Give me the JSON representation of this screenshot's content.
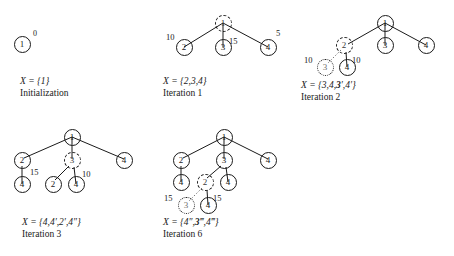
{
  "figure": {
    "background_color": "#ffffff",
    "line_color": "#1a1a1a",
    "dimmed_color": "#777777"
  },
  "panels": [
    {
      "id": "panel-initialization",
      "caption_set": "X = {1}",
      "caption_iteration": "Initialization",
      "superscript": "0",
      "nodes": [
        {
          "id": "n1",
          "label": "1",
          "style": "solid",
          "x": 22,
          "y": 44
        }
      ],
      "edges": [],
      "weights": []
    },
    {
      "id": "panel-iteration-1",
      "caption_set": "X = {2,3,4}",
      "caption_iteration": "Iteration 1",
      "nodes": [
        {
          "id": "n1",
          "label": "1",
          "style": "dashed",
          "x": 223,
          "y": 23
        },
        {
          "id": "n2",
          "label": "2",
          "style": "solid",
          "x": 184,
          "y": 47
        },
        {
          "id": "n3",
          "label": "3",
          "style": "solid",
          "x": 223,
          "y": 47
        },
        {
          "id": "n4",
          "label": "4",
          "style": "solid",
          "x": 268,
          "y": 47
        }
      ],
      "edges": [
        {
          "from": "n1",
          "to": "n2"
        },
        {
          "from": "n1",
          "to": "n3"
        },
        {
          "from": "n1",
          "to": "n4"
        }
      ],
      "weights": [
        {
          "value": "10",
          "x": 166,
          "y": 33
        },
        {
          "value": "15",
          "x": 229,
          "y": 37
        },
        {
          "value": "5",
          "x": 276,
          "y": 29
        }
      ]
    },
    {
      "id": "panel-iteration-2",
      "caption_set_parts": [
        "X = {3,4,",
        "3",
        "′,4′}"
      ],
      "caption_set": "X = {3,4,3′,4′}",
      "caption_iteration": "Iteration 2",
      "nodes": [
        {
          "id": "n1",
          "label": "1",
          "style": "solid",
          "x": 385,
          "y": 23
        },
        {
          "id": "n2",
          "label": "2",
          "style": "dashed",
          "x": 344,
          "y": 45
        },
        {
          "id": "n3",
          "label": "3",
          "style": "solid",
          "x": 385,
          "y": 45
        },
        {
          "id": "n4",
          "label": "4",
          "style": "solid",
          "x": 426,
          "y": 45
        },
        {
          "id": "n3p",
          "label": "3",
          "style": "dotted",
          "x": 325,
          "y": 67
        },
        {
          "id": "n4p",
          "label": "4",
          "style": "solid",
          "x": 347,
          "y": 67
        }
      ],
      "edges": [
        {
          "from": "n1",
          "to": "n2"
        },
        {
          "from": "n1",
          "to": "n3"
        },
        {
          "from": "n1",
          "to": "n4"
        },
        {
          "from": "n2",
          "to": "n3p",
          "style": "dotted"
        },
        {
          "from": "n2",
          "to": "n4p"
        }
      ],
      "weights": [
        {
          "value": "10",
          "x": 304,
          "y": 56
        },
        {
          "value": "10",
          "x": 352,
          "y": 56
        }
      ]
    },
    {
      "id": "panel-iteration-3",
      "caption_set": "X = {4,4′,2′,4″}",
      "caption_iteration": "Iteration 3",
      "nodes": [
        {
          "id": "n1",
          "label": "1",
          "style": "solid",
          "x": 72,
          "y": 137
        },
        {
          "id": "n2",
          "label": "2",
          "style": "solid",
          "x": 22,
          "y": 160
        },
        {
          "id": "n3",
          "label": "3",
          "style": "dashed",
          "x": 72,
          "y": 160
        },
        {
          "id": "n4",
          "label": "4",
          "style": "solid",
          "x": 124,
          "y": 160
        },
        {
          "id": "n4a",
          "label": "4",
          "style": "solid",
          "x": 22,
          "y": 184
        },
        {
          "id": "n2b",
          "label": "2",
          "style": "solid",
          "x": 53,
          "y": 184
        },
        {
          "id": "n4b",
          "label": "4",
          "style": "solid",
          "x": 76,
          "y": 184
        }
      ],
      "edges": [
        {
          "from": "n1",
          "to": "n2"
        },
        {
          "from": "n1",
          "to": "n3"
        },
        {
          "from": "n1",
          "to": "n4"
        },
        {
          "from": "n2",
          "to": "n4a"
        },
        {
          "from": "n3",
          "to": "n2b"
        },
        {
          "from": "n3",
          "to": "n4b"
        }
      ],
      "weights": [
        {
          "value": "15",
          "x": 30,
          "y": 168
        },
        {
          "value": "10",
          "x": 82,
          "y": 170
        }
      ]
    },
    {
      "id": "panel-iteration-6",
      "caption_set_parts": [
        "X = {4″,",
        "3",
        "‴,4‴}"
      ],
      "caption_set": "X = {4″,3‴,4‴}",
      "caption_iteration": "Iteration 6",
      "nodes": [
        {
          "id": "n1",
          "label": "1",
          "style": "solid",
          "x": 224,
          "y": 137
        },
        {
          "id": "n2",
          "label": "2",
          "style": "solid",
          "x": 181,
          "y": 160
        },
        {
          "id": "n3",
          "label": "3",
          "style": "solid",
          "x": 224,
          "y": 160
        },
        {
          "id": "n4",
          "label": "4",
          "style": "solid",
          "x": 268,
          "y": 160
        },
        {
          "id": "n4a",
          "label": "4",
          "style": "solid",
          "x": 181,
          "y": 182
        },
        {
          "id": "n2b",
          "label": "2",
          "style": "dashed",
          "x": 205,
          "y": 182
        },
        {
          "id": "n4c",
          "label": "4",
          "style": "solid",
          "x": 228,
          "y": 182
        },
        {
          "id": "n3d",
          "label": "3",
          "style": "dotted",
          "x": 186,
          "y": 205
        },
        {
          "id": "n4d",
          "label": "4",
          "style": "solid",
          "x": 208,
          "y": 205
        }
      ],
      "edges": [
        {
          "from": "n1",
          "to": "n2"
        },
        {
          "from": "n1",
          "to": "n3"
        },
        {
          "from": "n1",
          "to": "n4"
        },
        {
          "from": "n2",
          "to": "n4a"
        },
        {
          "from": "n3",
          "to": "n2b"
        },
        {
          "from": "n3",
          "to": "n4c"
        },
        {
          "from": "n2b",
          "to": "n3d",
          "style": "dotted"
        },
        {
          "from": "n2b",
          "to": "n4d"
        }
      ],
      "weights": [
        {
          "value": "15",
          "x": 164,
          "y": 194
        },
        {
          "value": "15",
          "x": 213,
          "y": 194
        }
      ]
    }
  ]
}
